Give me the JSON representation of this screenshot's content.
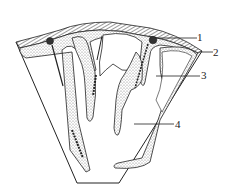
{
  "diagram": {
    "labels": [
      {
        "id": "1",
        "text": "1"
      },
      {
        "id": "2",
        "text": "2"
      },
      {
        "id": "3",
        "text": "3"
      },
      {
        "id": "4",
        "text": "4"
      }
    ],
    "colors": {
      "line": "#222222",
      "stipple": "#8a8a8a",
      "background": "#ffffff"
    }
  }
}
